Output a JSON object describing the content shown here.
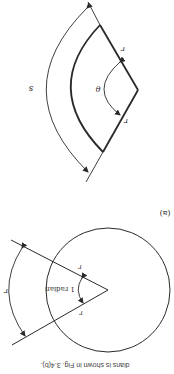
{
  "figure": {
    "orientation": "rotated-180",
    "caption": "dians is shown in Fig. 3.4(b).",
    "panel_a": {
      "label": "(a)",
      "radius_label": "r",
      "angle_label": "1 radian",
      "arc_label": "r"
    },
    "panel_b": {
      "radius_label": "r",
      "angle_label": "θ",
      "arc_label": "s"
    },
    "colors": {
      "line": "#2a2a2a",
      "background": "#ffffff"
    }
  }
}
